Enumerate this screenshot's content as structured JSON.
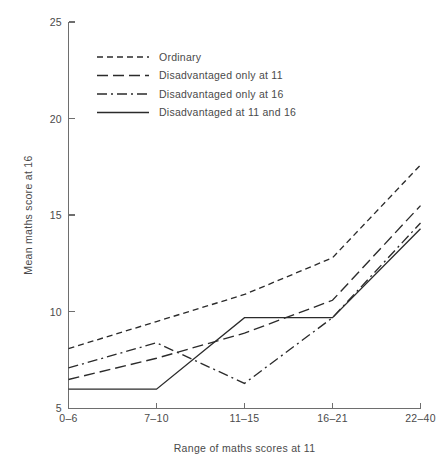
{
  "chart_data": {
    "type": "line",
    "title": "",
    "xlabel": "Range of maths scores at 11",
    "ylabel": "Mean maths score at 16",
    "categories": [
      "0–6",
      "7–10",
      "11–15",
      "16–21",
      "22–40"
    ],
    "ylim": [
      5,
      25
    ],
    "yticks": [
      5,
      10,
      15,
      20,
      25
    ],
    "ytick_labels": [
      "5",
      "10",
      "15",
      "20",
      "25"
    ],
    "grid": false,
    "legend_position": "top-left-inside",
    "series": [
      {
        "name": "Ordinary",
        "style": "short-dash",
        "dasharray": "6,4",
        "color": "#2b2b2b",
        "values": [
          8.1,
          9.5,
          10.9,
          12.8,
          17.6
        ]
      },
      {
        "name": "Disadvantaged only at 11",
        "style": "long-dash",
        "dasharray": "11,5",
        "color": "#2b2b2b",
        "values": [
          6.5,
          7.6,
          8.9,
          10.6,
          15.5
        ]
      },
      {
        "name": "Disadvantaged only at 16",
        "style": "dash-dot",
        "dasharray": "10,4,2,4",
        "color": "#2b2b2b",
        "values": [
          7.1,
          8.4,
          6.3,
          9.7,
          14.6
        ]
      },
      {
        "name": "Disadvantaged at 11 and 16",
        "style": "solid",
        "dasharray": "none",
        "color": "#2b2b2b",
        "values": [
          6.0,
          6.0,
          9.7,
          9.7,
          14.3
        ]
      }
    ]
  },
  "axes": {
    "y_label_text": "Mean maths score at 16",
    "x_label_text": "Range of maths scores at 11"
  }
}
